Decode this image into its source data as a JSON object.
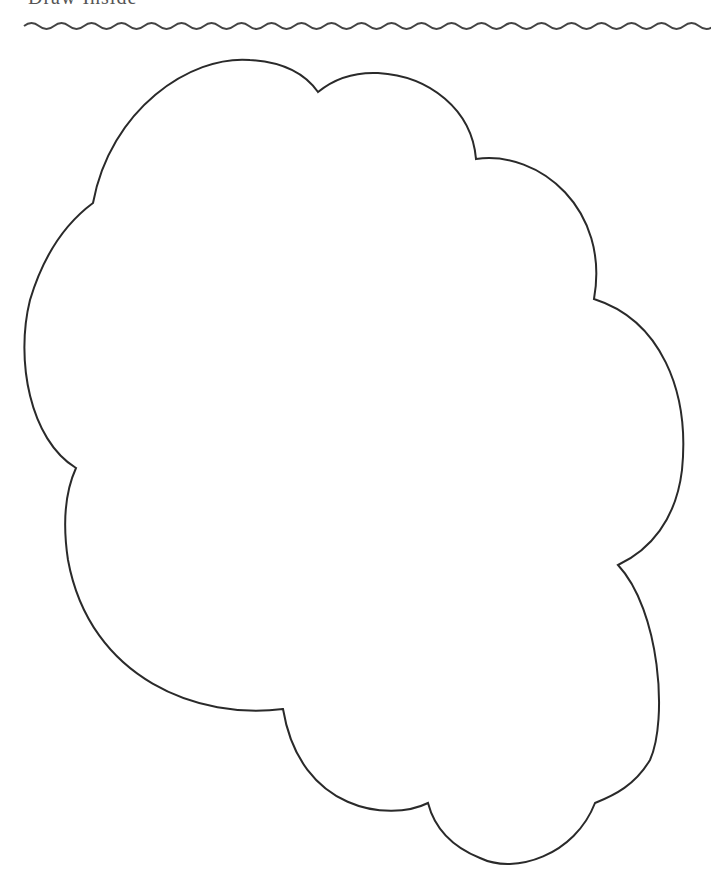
{
  "page": {
    "header_text": "Draw Inside",
    "header_note": "Header text is cropped at the top edge; only the lower portions of the glyphs are visible."
  },
  "divider": {
    "style": "wavy",
    "color": "#444444",
    "y": 26,
    "x_start": 24,
    "x_end": 688,
    "period": 30,
    "amplitude": 3
  },
  "shape": {
    "name": "cloud outline",
    "fill": "#ffffff",
    "stroke": "#2a2a2a",
    "stroke_width": 2
  }
}
